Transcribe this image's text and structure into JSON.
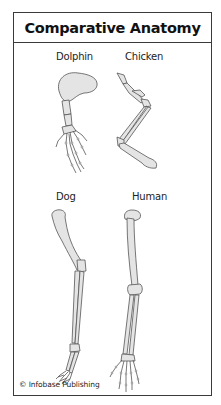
{
  "title": "Comparative Anatomy",
  "specimens": [
    {
      "name": "Dolphin"
    },
    {
      "name": "Chicken"
    },
    {
      "name": "Dog"
    },
    {
      "name": "Human"
    }
  ],
  "credit": "© Infobase Publishing",
  "colors": {
    "frame": "#3a3a3a",
    "bone_fill": "#e4e4e4",
    "bone_stroke": "#555555",
    "background": "#ffffff"
  }
}
